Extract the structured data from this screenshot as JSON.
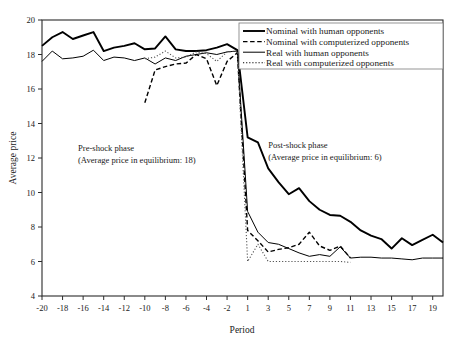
{
  "chart_data": {
    "type": "line",
    "title": "",
    "xlabel": "Period",
    "ylabel": "Average price",
    "xlim": [
      -20,
      20
    ],
    "ylim": [
      4,
      20
    ],
    "grid": false,
    "legend_position": "top-right",
    "xticks": [
      -20,
      -18,
      -16,
      -14,
      -12,
      -10,
      -8,
      -6,
      -4,
      -2,
      1,
      3,
      5,
      7,
      9,
      11,
      13,
      15,
      17,
      19
    ],
    "xtick_labels": [
      "-20",
      "-18",
      "-16",
      "-14",
      "-12",
      "-10",
      "-8",
      "-6",
      "-4",
      "-2",
      "1",
      "3",
      "5",
      "7",
      "9",
      "11",
      "13",
      "15",
      "17",
      "19"
    ],
    "yticks": [
      4,
      6,
      8,
      10,
      12,
      14,
      16,
      18,
      20
    ],
    "ytick_labels": [
      "4",
      "6",
      "8",
      "10",
      "12",
      "14",
      "16",
      "18",
      "20"
    ],
    "annotations": [
      {
        "name": "pre-shock-annotation",
        "line1": "Pre-shock phase",
        "line2": "(Average price in equilibrium: 18)",
        "x": -16.5,
        "y": 12.4
      },
      {
        "name": "post-shock-annotation",
        "line1": "Post-shock phase",
        "line2": "(Average price in equilibrium: 6)",
        "x": 3.0,
        "y": 12.6
      }
    ],
    "series": [
      {
        "name": "Nominal with human opponents",
        "style": "solid-thick",
        "color": "#000000",
        "x": [
          -20,
          -19,
          -18,
          -17,
          -16,
          -15,
          -14,
          -13,
          -12,
          -11,
          -10,
          -9,
          -8,
          -7,
          -6,
          -5,
          -4,
          -3,
          -2,
          -1,
          1,
          2,
          3,
          4,
          5,
          6,
          7,
          8,
          9,
          10,
          11,
          12,
          13,
          14,
          15,
          16,
          17,
          18,
          19,
          20
        ],
        "values": [
          18.5,
          19.0,
          19.3,
          18.9,
          19.1,
          19.3,
          18.2,
          18.4,
          18.5,
          18.65,
          18.3,
          18.35,
          19.05,
          18.3,
          18.2,
          18.2,
          18.25,
          18.4,
          18.6,
          18.25,
          13.2,
          12.9,
          11.4,
          10.6,
          9.9,
          10.25,
          9.5,
          9.0,
          8.7,
          8.65,
          8.3,
          7.8,
          7.5,
          7.3,
          6.75,
          7.35,
          6.95,
          7.25,
          7.55,
          7.1
        ]
      },
      {
        "name": "Nominal with computerized opponents",
        "style": "dashed",
        "color": "#000000",
        "x": [
          -10,
          -9,
          -8,
          -7,
          -6,
          -5,
          -4,
          -3,
          -2,
          -1,
          1,
          2,
          3,
          4,
          5,
          6,
          7,
          8,
          9,
          10,
          11
        ],
        "values": [
          15.2,
          17.1,
          17.3,
          17.45,
          17.5,
          18.0,
          17.75,
          16.2,
          17.6,
          18.1,
          7.8,
          7.2,
          6.55,
          6.7,
          6.8,
          7.0,
          7.7,
          6.9,
          6.65,
          6.9,
          6.2
        ]
      },
      {
        "name": "Real with human opponents",
        "style": "solid-thin",
        "color": "#000000",
        "x": [
          -20,
          -19,
          -18,
          -17,
          -16,
          -15,
          -14,
          -13,
          -12,
          -11,
          -10,
          -9,
          -8,
          -7,
          -6,
          -5,
          -4,
          -3,
          -2,
          -1,
          1,
          2,
          3,
          4,
          5,
          6,
          7,
          8,
          9,
          10,
          11,
          12,
          13,
          14,
          15,
          16,
          17,
          18,
          19,
          20
        ],
        "values": [
          17.6,
          18.2,
          17.75,
          17.8,
          17.9,
          18.25,
          17.65,
          17.85,
          17.8,
          17.65,
          17.8,
          17.45,
          17.8,
          17.65,
          17.9,
          18.0,
          18.1,
          18.0,
          18.15,
          18.2,
          8.9,
          7.7,
          7.1,
          7.0,
          6.75,
          6.5,
          6.3,
          6.4,
          6.3,
          6.85,
          6.2,
          6.25,
          6.25,
          6.2,
          6.2,
          6.15,
          6.1,
          6.2,
          6.2,
          6.2
        ]
      },
      {
        "name": "Real with computerized opponents",
        "style": "dotted",
        "color": "#555555",
        "x": [
          -10,
          -9,
          -8,
          -7,
          -6,
          -5,
          -4,
          -3,
          -2,
          -1,
          1,
          2,
          3,
          4,
          5,
          6,
          7,
          8,
          9,
          10,
          11
        ],
        "values": [
          17.75,
          17.85,
          18.2,
          17.8,
          17.85,
          18.15,
          18.05,
          17.6,
          18.15,
          18.2,
          6.0,
          7.0,
          6.0,
          6.0,
          6.0,
          6.0,
          6.0,
          6.0,
          6.0,
          6.0,
          5.95
        ]
      }
    ],
    "legend": [
      {
        "label": "Nominal with human opponents",
        "style": "solid-thick"
      },
      {
        "label": "Nominal with computerized opponents",
        "style": "dashed"
      },
      {
        "label": "Real with human opponents",
        "style": "solid-thin"
      },
      {
        "label": "Real with computerized opponents",
        "style": "dotted"
      }
    ]
  }
}
